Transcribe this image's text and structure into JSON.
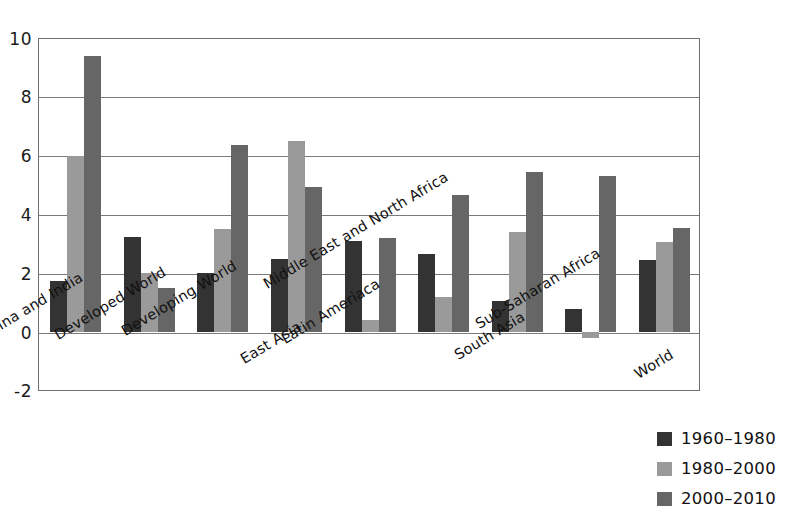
{
  "chart_data": {
    "type": "bar",
    "title": "",
    "subtitle": "",
    "xlabel": "",
    "ylabel": "",
    "ylim": [
      -2,
      10
    ],
    "yticks": [
      -2,
      0,
      2,
      4,
      6,
      8,
      10
    ],
    "ytick_labels": [
      "-2",
      "0",
      "2",
      "4",
      "6",
      "8",
      "10"
    ],
    "grid": true,
    "gridlines_at": [
      0,
      2,
      4,
      6,
      8,
      10
    ],
    "legend_position": "bottom-right",
    "categories": [
      "China and India",
      "Developed World",
      "Developing World",
      "East Asia",
      "Latin Ameriaca",
      "Middle East and North Africa",
      "South Asia",
      "Sub-Saharan Africa",
      "World"
    ],
    "series": [
      {
        "name": "1960–1980",
        "color": "#333333",
        "values": [
          1.75,
          3.25,
          2.0,
          2.5,
          3.1,
          2.65,
          1.05,
          0.8,
          2.45
        ]
      },
      {
        "name": "1980–2000",
        "color": "#9a9a9a",
        "values": [
          6.0,
          2.0,
          3.5,
          6.5,
          0.4,
          1.2,
          3.4,
          -0.2,
          3.05
        ]
      },
      {
        "name": "2000–2010",
        "color": "#666666",
        "values": [
          9.4,
          1.5,
          6.35,
          4.95,
          3.2,
          4.65,
          5.45,
          5.3,
          3.55
        ]
      }
    ]
  },
  "legend": {
    "items": [
      {
        "label": "1960–1980",
        "color": "#333333"
      },
      {
        "label": "1980–2000",
        "color": "#9a9a9a"
      },
      {
        "label": "2000–2010",
        "color": "#666666"
      }
    ]
  },
  "axis": {
    "y_tick_labels": [
      "10",
      "8",
      "6",
      "4",
      "2",
      "0",
      "-2"
    ]
  }
}
